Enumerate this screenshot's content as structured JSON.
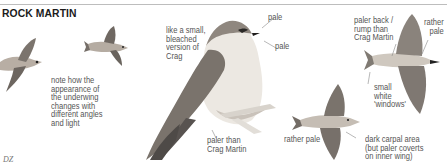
{
  "header": {
    "title": "ROCK MARTIN"
  },
  "annotations": {
    "underwing_note": [
      "note how the",
      "appearance of",
      "the underwing",
      "changes with",
      "different angles",
      "and light"
    ],
    "bleached_note": [
      "like a small,",
      "bleached",
      "version of",
      "Crag"
    ],
    "pale_1": "pale",
    "pale_2": "pale",
    "paler_than_crag": [
      "paler than",
      "Crag Martin"
    ],
    "paler_back": [
      "paler back /",
      "rump than",
      "Crag Martin"
    ],
    "rather_pale_top": [
      "rather",
      "pale"
    ],
    "small_white_windows": [
      "small",
      "white",
      "'windows'"
    ],
    "rather_pale_bottom": "rather pale",
    "dark_carpal": [
      "dark carpal area",
      "(but paler coverts",
      "on inner wing)"
    ]
  },
  "footer": {
    "credit": "DZ"
  },
  "colors": {
    "title": "#1a1a1a",
    "text": "#555555",
    "bird_dark": "#6e6a66",
    "bird_mid": "#9a928a",
    "bird_light": "#d9d3cb",
    "bird_belly": "#ece8e2"
  }
}
